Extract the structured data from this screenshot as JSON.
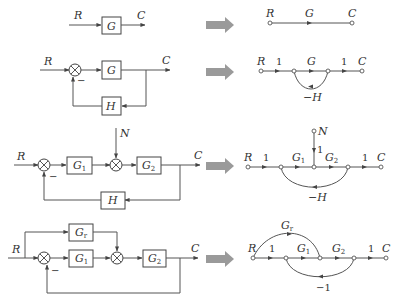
{
  "diagrams": [
    {
      "block": {
        "input": "R",
        "output": "C",
        "blocks": [
          {
            "label": "G"
          }
        ]
      },
      "flow_graph": {
        "input": "R",
        "output": "C",
        "branches": [
          {
            "gain": "G"
          }
        ]
      }
    },
    {
      "block": {
        "input": "R",
        "output": "C",
        "blocks": [
          {
            "label": "G"
          },
          {
            "label": "H"
          }
        ],
        "summer_sign": "−"
      },
      "flow_graph": {
        "input": "R",
        "output": "C",
        "branches": [
          {
            "gain": "1"
          },
          {
            "gain": "G"
          },
          {
            "gain": "1"
          },
          {
            "gain": "−H"
          }
        ]
      }
    },
    {
      "block": {
        "input": "R",
        "output": "C",
        "disturbance": "N",
        "blocks": [
          {
            "label": "G",
            "sub": "1"
          },
          {
            "label": "G",
            "sub": "2"
          },
          {
            "label": "H"
          }
        ],
        "summer_sign": "−"
      },
      "flow_graph": {
        "input": "R",
        "output": "C",
        "disturbance": "N",
        "branches": [
          {
            "gain": "1"
          },
          {
            "gain": "G",
            "sub": "1"
          },
          {
            "gain": "G",
            "sub": "2"
          },
          {
            "gain": "1"
          },
          {
            "gain": "−H"
          },
          {
            "gain": "1"
          }
        ]
      }
    },
    {
      "block": {
        "input": "R",
        "output": "C",
        "blocks": [
          {
            "label": "G",
            "sub": "r"
          },
          {
            "label": "G",
            "sub": "1"
          },
          {
            "label": "G",
            "sub": "2"
          }
        ],
        "summer_sign": "−"
      },
      "flow_graph": {
        "input": "R",
        "output": "C",
        "branches": [
          {
            "gain": "G",
            "sub": "r"
          },
          {
            "gain": "1"
          },
          {
            "gain": "G",
            "sub": "1"
          },
          {
            "gain": "G",
            "sub": "2"
          },
          {
            "gain": "1"
          },
          {
            "gain": "−1"
          }
        ]
      }
    }
  ],
  "colors": {
    "line": "#555555",
    "transform_arrow": "#9a9a9a"
  }
}
